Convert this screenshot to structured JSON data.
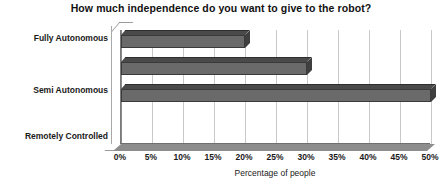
{
  "chart_data": {
    "type": "bar",
    "orientation": "horizontal",
    "title": "How much independence do you want to give to the robot?",
    "xlabel": "Percentage of people",
    "ylabel": "",
    "categories": [
      "Fully Autonomous",
      "Semi Autonomous",
      "Remotely Controlled"
    ],
    "values": [
      20,
      30,
      50
    ],
    "value_suffix": "%",
    "xlim": [
      0,
      50
    ],
    "xticks": [
      0,
      5,
      10,
      15,
      20,
      25,
      30,
      35,
      40,
      45,
      50
    ],
    "xtick_labels": [
      "0%",
      "5%",
      "10%",
      "15%",
      "20%",
      "25%",
      "30%",
      "35%",
      "40%",
      "45%",
      "50%"
    ],
    "grid": true,
    "grid_axis": "x",
    "legend": false,
    "style_3d": true,
    "colors": {
      "bar_face": "#6a6a6a",
      "bar_top": "#4a4a4a",
      "bar_cap": "#3f3f3f",
      "bar_edge": "#3a3a3a",
      "gridline": "#c9c9c9",
      "axis": "#8a8a8a",
      "floor": "#8d8d8d",
      "plot_background": "#ffffff",
      "text": "#1a1a1a"
    },
    "bars": [
      {
        "category": "Fully Autonomous",
        "value": 20,
        "label": "20%"
      },
      {
        "category": "Semi Autonomous",
        "value": 30,
        "label": "30%"
      },
      {
        "category": "Remotely Controlled",
        "value": 50,
        "label": "50%"
      }
    ]
  }
}
